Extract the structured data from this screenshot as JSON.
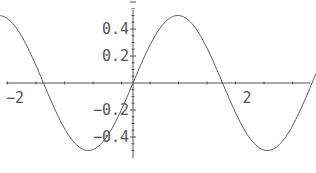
{
  "chart_data": {
    "type": "line",
    "title": "",
    "xlabel": "",
    "ylabel": "",
    "function": "0.5*sin(2x)",
    "series": [
      {
        "name": "0.5 sin(2x)",
        "amplitude": 0.5,
        "frequency": 2,
        "x_range": [
          -3.93,
          5.8
        ],
        "samples_x": [
          -3.93,
          -3.14,
          -2.36,
          -1.57,
          -0.79,
          0,
          0.79,
          1.57,
          2.36,
          3.14,
          3.93,
          4.71,
          5.5,
          5.8
        ],
        "samples_y": [
          -0.5,
          0,
          0.5,
          0,
          -0.5,
          0,
          0.5,
          0,
          -0.5,
          0,
          0.5,
          0,
          -0.5,
          -0.23
        ]
      }
    ],
    "xlim": [
      -4.3,
      6.3
    ],
    "ylim": [
      -0.53,
      0.61
    ],
    "x_ticks": [
      -4,
      -2,
      2,
      4,
      6
    ],
    "x_tick_labels": [
      "-4",
      "-2",
      "2",
      "4",
      "6"
    ],
    "y_ticks": [
      -0.4,
      -0.2,
      0.2,
      0.4
    ],
    "y_tick_labels": [
      "-0.4",
      "-0.2",
      "0.2",
      "0.4"
    ],
    "grid": false,
    "legend": "none"
  }
}
